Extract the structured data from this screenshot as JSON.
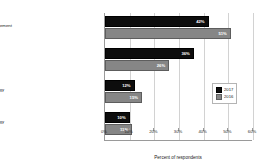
{
  "chart_data": {
    "type": "bar",
    "orientation": "horizontal",
    "title": "",
    "xlabel": "Percent of respondents",
    "ylabel": "",
    "xlim": [
      0,
      60
    ],
    "xticks": [
      "0%",
      "10%",
      "20%",
      "30%",
      "40%",
      "50%",
      "60%"
    ],
    "xtick_values": [
      0,
      10,
      20,
      30,
      40,
      50,
      60
    ],
    "grid": true,
    "legend_position": "middle-right",
    "categories": [
      "Methodology from a change-management provider/thought-leader",
      "Combination/hybrid mixture",
      "Internally developed methodology",
      "Consultant-provided methodology"
    ],
    "series": [
      {
        "name": "2017",
        "color": "#0d0d0d",
        "values": [
          42,
          36,
          12,
          10
        ],
        "labels": [
          "42%",
          "36%",
          "12%",
          "10%"
        ]
      },
      {
        "name": "2016",
        "color": "#868686",
        "values": [
          51,
          26,
          15,
          11
        ],
        "labels": [
          "51%",
          "26%",
          "15%",
          "11%"
        ]
      }
    ]
  }
}
